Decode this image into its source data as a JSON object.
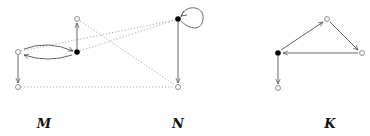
{
  "labels": {
    "M": "M",
    "N": "N",
    "K": "K"
  },
  "colors": {
    "edge": "#555555",
    "dotted": "#aaaaaa",
    "filled_node": "#000000",
    "open_node": "#888888"
  },
  "graphs": [
    {
      "name": "M",
      "nodes": [
        {
          "id": "m_left",
          "x": 18,
          "y": 52,
          "filled": false
        },
        {
          "id": "m_bottom",
          "x": 18,
          "y": 87,
          "filled": false
        },
        {
          "id": "m_center",
          "x": 77,
          "y": 52,
          "filled": true
        },
        {
          "id": "m_top",
          "x": 77,
          "y": 19,
          "filled": false
        }
      ],
      "edges": [
        {
          "from": "m_left",
          "to": "m_bottom",
          "style": "solid"
        },
        {
          "from": "m_left",
          "to": "m_center",
          "style": "curved-solid"
        },
        {
          "from": "m_center",
          "to": "m_left",
          "style": "curved-solid"
        },
        {
          "from": "m_center",
          "to": "m_top",
          "style": "solid"
        }
      ]
    },
    {
      "name": "N",
      "nodes": [
        {
          "id": "n_top",
          "x": 178,
          "y": 19,
          "filled": true
        },
        {
          "id": "n_bottom",
          "x": 178,
          "y": 87,
          "filled": false
        }
      ],
      "edges": [
        {
          "from": "n_top",
          "to": "n_top",
          "style": "loop"
        },
        {
          "from": "n_top",
          "to": "n_bottom",
          "style": "solid"
        }
      ]
    },
    {
      "name": "K",
      "nodes": [
        {
          "id": "k_center",
          "x": 278,
          "y": 53,
          "filled": true
        },
        {
          "id": "k_top",
          "x": 327,
          "y": 19,
          "filled": false
        },
        {
          "id": "k_right",
          "x": 362,
          "y": 53,
          "filled": false
        },
        {
          "id": "k_bottom",
          "x": 278,
          "y": 88,
          "filled": false
        }
      ],
      "edges": [
        {
          "from": "k_center",
          "to": "k_top",
          "style": "solid"
        },
        {
          "from": "k_top",
          "to": "k_right",
          "style": "solid"
        },
        {
          "from": "k_right",
          "to": "k_center",
          "style": "solid"
        },
        {
          "from": "k_center",
          "to": "k_bottom",
          "style": "solid"
        }
      ]
    }
  ],
  "correspondences": [
    {
      "from": "m_left",
      "to": "n_top",
      "style": "dotted"
    },
    {
      "from": "m_center",
      "to": "n_top",
      "style": "dotted"
    },
    {
      "from": "m_top",
      "to": "n_bottom",
      "style": "dotted"
    },
    {
      "from": "m_bottom",
      "to": "n_bottom",
      "style": "dotted"
    }
  ]
}
